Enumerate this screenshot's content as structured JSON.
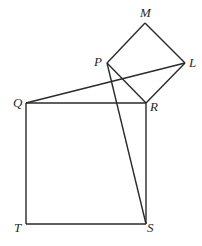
{
  "diagram": {
    "stroke_color": "#2a2a2a",
    "points": {
      "M": [
        145,
        23
      ],
      "P": [
        107,
        63
      ],
      "L": [
        185,
        63
      ],
      "Q": [
        26,
        103
      ],
      "R": [
        146,
        103
      ],
      "T": [
        26,
        224
      ],
      "S": [
        146,
        224
      ]
    },
    "labels": [
      {
        "id": "M",
        "text": "M",
        "x": 140,
        "y": 6
      },
      {
        "id": "P",
        "text": "P",
        "x": 94,
        "y": 55
      },
      {
        "id": "L",
        "text": "L",
        "x": 189,
        "y": 56
      },
      {
        "id": "Q",
        "text": "Q",
        "x": 13,
        "y": 96
      },
      {
        "id": "R",
        "text": "R",
        "x": 150,
        "y": 100
      },
      {
        "id": "T",
        "text": "T",
        "x": 14,
        "y": 221
      },
      {
        "id": "S",
        "text": "S",
        "x": 147,
        "y": 221
      }
    ],
    "segments": [
      [
        "P",
        "M"
      ],
      [
        "M",
        "L"
      ],
      [
        "L",
        "R"
      ],
      [
        "R",
        "P"
      ],
      [
        "Q",
        "R"
      ],
      [
        "R",
        "S"
      ],
      [
        "S",
        "T"
      ],
      [
        "T",
        "Q"
      ],
      [
        "Q",
        "L"
      ],
      [
        "P",
        "S"
      ]
    ]
  }
}
